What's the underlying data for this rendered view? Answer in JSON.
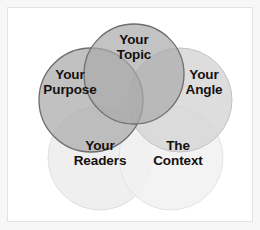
{
  "diagram": {
    "type": "venn",
    "title": "",
    "background_color": "#ffffff",
    "frame_color": "#e3e3e3",
    "label_color": "#15100e",
    "circles": [
      {
        "id": "your-topic",
        "label": "Your\nTopic",
        "label_line1": "Your",
        "label_line2": "Topic",
        "fill_color": "#a9a9a9",
        "stroke_color": "#6e6e6e",
        "cx": 126,
        "cy": 66,
        "r": 50,
        "label_x": 126,
        "label_y": 47,
        "opacity": 0.72
      },
      {
        "id": "your-purpose",
        "label": "Your\nPurpose",
        "label_line1": "Your",
        "label_line2": "Purpose",
        "fill_color": "#a9a9a9",
        "stroke_color": "#6e6e6e",
        "cx": 83,
        "cy": 92,
        "r": 52,
        "label_x": 62,
        "label_y": 82,
        "opacity": 0.72
      },
      {
        "id": "your-angle",
        "label": "Your\nAngle",
        "label_line1": "Your",
        "label_line2": "Angle",
        "fill_color": "#d4d4d4",
        "stroke_color": "#c0c0c0",
        "cx": 172,
        "cy": 92,
        "r": 52,
        "label_x": 196,
        "label_y": 82,
        "opacity": 0.75
      },
      {
        "id": "your-readers",
        "label": "Your\nReaders",
        "label_line1": "Your",
        "label_line2": "Readers",
        "fill_color": "#ececec",
        "stroke_color": "#e0e0e0",
        "cx": 92,
        "cy": 150,
        "r": 52,
        "label_x": 88,
        "label_y": 152,
        "opacity": 0.85
      },
      {
        "id": "the-context",
        "label": "The\nContext",
        "label_line1": "The",
        "label_line2": "Context",
        "fill_color": "#f1f1f1",
        "stroke_color": "#e4e4e4",
        "cx": 163,
        "cy": 150,
        "r": 52,
        "label_x": 168,
        "label_y": 152,
        "opacity": 0.85
      }
    ]
  }
}
